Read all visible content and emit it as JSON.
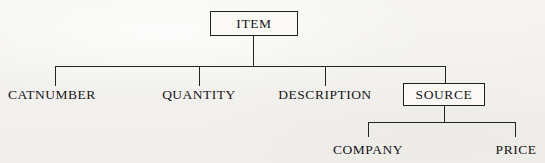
{
  "diagram": {
    "type": "hierarchy-tree",
    "title": "",
    "background_color": "#f2f1ed",
    "line_color": "#25251f",
    "text_color": "#16161a",
    "root": {
      "label": "ITEM",
      "boxed": true
    },
    "level2": [
      {
        "label": "CATNUMBER",
        "boxed": false
      },
      {
        "label": "QUANTITY",
        "boxed": false
      },
      {
        "label": "DESCRIPTION",
        "boxed": false
      },
      {
        "label": "SOURCE",
        "boxed": true
      }
    ],
    "level3": [
      {
        "label": "COMPANY",
        "boxed": false,
        "parent": "SOURCE"
      },
      {
        "label": "PRICE",
        "boxed": false,
        "parent": "SOURCE"
      }
    ]
  }
}
